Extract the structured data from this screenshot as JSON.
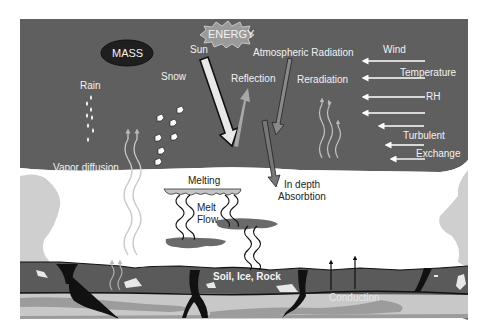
{
  "diagram": {
    "colors": {
      "atmosphere": "#5f5f5f",
      "snowpack": "#ffffff",
      "snow_edge": "#cfcfcf",
      "soil": "#5a5a5a",
      "soil_dark": "#1a1a1a",
      "subsoil_light": "#c8c8c8",
      "subsoil_mid": "#9c9c9c",
      "mass_oval": "#1f1f1f",
      "energy_burst": "#9a9a9a",
      "sun_arrow": "#e8e8e8",
      "reflection_arrow": "#a8a8a8",
      "atm_arrow": "#8a8a8a",
      "melt_layer": "#c4c4c4",
      "melt_puddle": "#6a6a6a",
      "wind_arrow": "#ffffff"
    },
    "labels": {
      "energy": "ENERGY",
      "mass": "MASS",
      "sun": "Sun",
      "atmospheric_radiation": "Atmospheric Radiation",
      "wind": "Wind",
      "temperature": "Temperature",
      "rh": "RH",
      "turbulent": "Turbulent",
      "exchange": "Exchange",
      "rain": "Rain",
      "snow": "Snow",
      "reflection": "Reflection",
      "reradiation": "Reradiation",
      "vapor_diffusion": "Vapor diffusion",
      "melting": "Melting",
      "melt": "Melt",
      "flow": "Flow",
      "in_depth": "In depth",
      "absorbtion": "Absorbtion",
      "soil_ice_rock": "Soil, Ice, Rock",
      "conduction": "Conduction"
    },
    "icons": [
      "sun-arrow",
      "reflection-arrow",
      "atmospheric-radiation-arrow",
      "in-depth-absorption-arrow",
      "wind-arrows",
      "rain-drops",
      "snow-flakes",
      "vapor-diffusion-waves",
      "reradiation-waves",
      "melt-flow-waves",
      "conduction-arrows",
      "energy-burst",
      "mass-oval"
    ]
  }
}
